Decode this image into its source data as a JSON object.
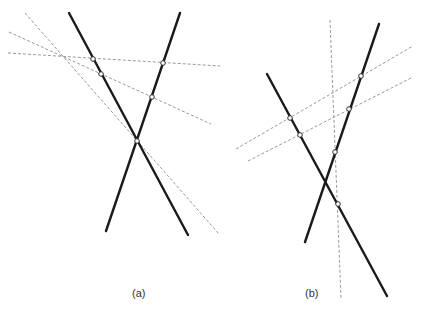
{
  "panels": [
    {
      "id": "a",
      "caption": "(a)",
      "description": "Two solid lines crossing, cut by three dashed transversals that converge at a common point; open circles mark the intersections."
    },
    {
      "id": "b",
      "caption": "(b)",
      "description": "Two solid lines crossing, cut by two parallel dashed transversals and a near-vertical dashed line; open circles mark the intersections."
    }
  ],
  "colors": {
    "solid_line": "#1a1a1a",
    "dashed_line": "#9a9a9a",
    "marker_fill": "#ffffff",
    "background": "#ffffff"
  }
}
